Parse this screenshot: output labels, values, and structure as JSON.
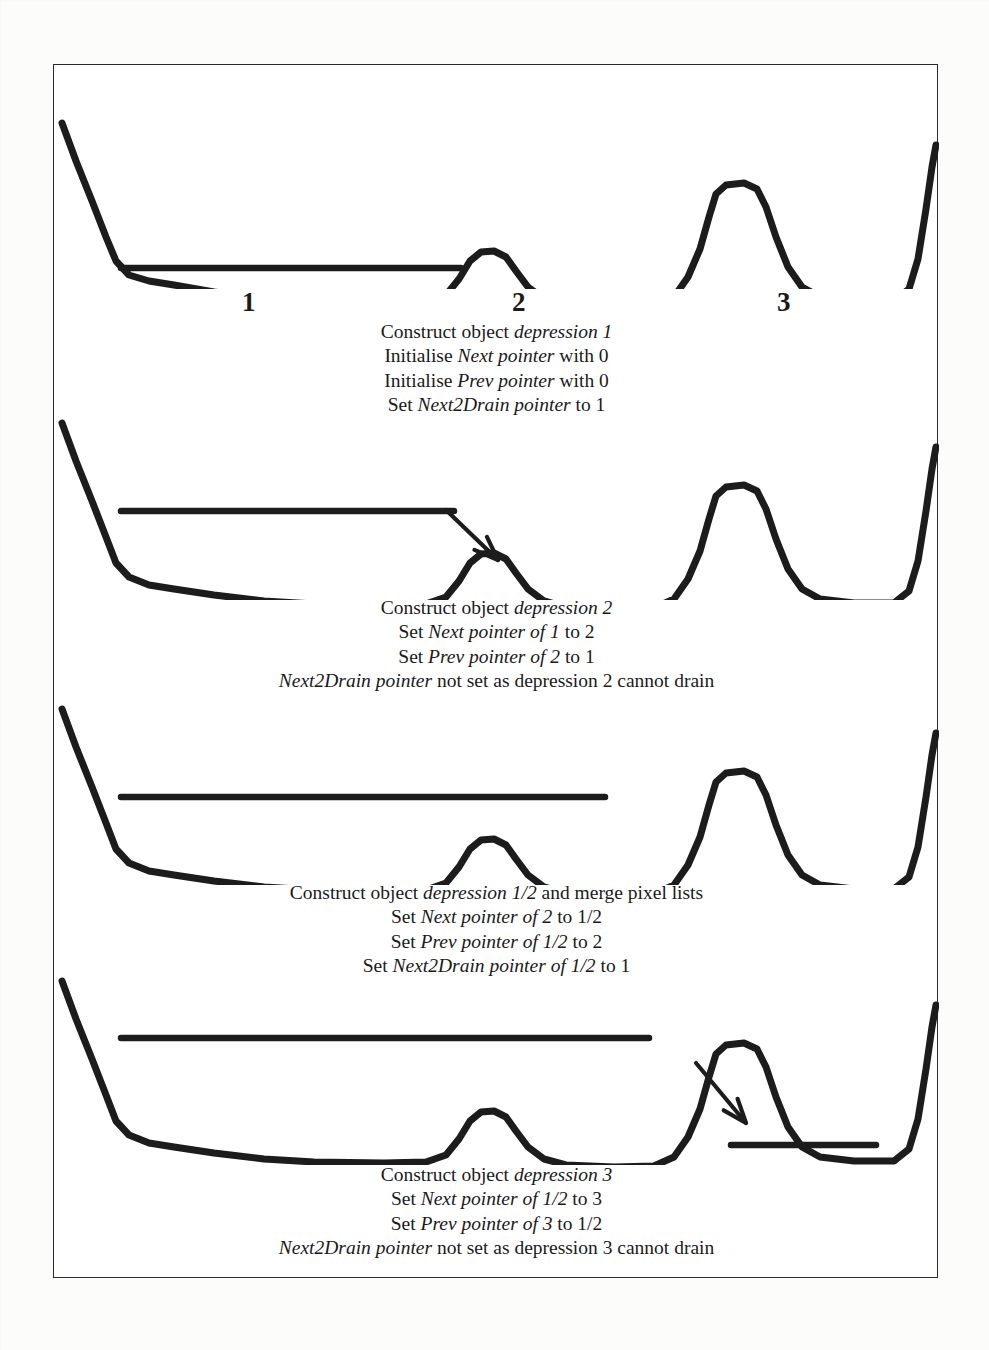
{
  "figure": {
    "depression_labels": [
      {
        "text": "1",
        "x": 188
      },
      {
        "text": "2",
        "x": 458
      },
      {
        "text": "3",
        "x": 723
      }
    ],
    "panels": [
      {
        "id": "panel-1",
        "name": "depression-1-fills",
        "caption": [
          {
            "parts": [
              {
                "t": "Construct object ",
                "i": false
              },
              {
                "t": "depression 1",
                "i": true
              }
            ]
          },
          {
            "parts": [
              {
                "t": "Initialise ",
                "i": false
              },
              {
                "t": "Next pointer",
                "i": true
              },
              {
                "t": " with 0",
                "i": false
              }
            ]
          },
          {
            "parts": [
              {
                "t": "Initialise ",
                "i": false
              },
              {
                "t": "Prev pointer",
                "i": true
              },
              {
                "t": " with 0",
                "i": false
              }
            ]
          },
          {
            "parts": [
              {
                "t": "Set ",
                "i": false
              },
              {
                "t": "Next2Drain pointer",
                "i": true
              },
              {
                "t": " to 1",
                "i": false
              }
            ]
          }
        ],
        "water_lines": [
          {
            "x1": 67,
            "x2": 407,
            "y": 179
          }
        ],
        "arrows": []
      },
      {
        "id": "panel-2",
        "name": "depression-2-spill",
        "caption": [
          {
            "parts": [
              {
                "t": "Construct object ",
                "i": false
              },
              {
                "t": "depression 2",
                "i": true
              }
            ]
          },
          {
            "parts": [
              {
                "t": "Set ",
                "i": false
              },
              {
                "t": "Next pointer of 1",
                "i": true
              },
              {
                "t": " to 2",
                "i": false
              }
            ]
          },
          {
            "parts": [
              {
                "t": "Set ",
                "i": false
              },
              {
                "t": "Prev pointer of 2",
                "i": true
              },
              {
                "t": " to 1",
                "i": false
              }
            ]
          },
          {
            "parts": [
              {
                "t": "Next2Drain pointer",
                "i": true
              },
              {
                "t": " not set as depression 2 cannot drain",
                "i": false
              }
            ]
          }
        ],
        "water_lines": [
          {
            "x1": 67,
            "x2": 400,
            "y": 106
          }
        ],
        "arrows": [
          {
            "x1": 392,
            "y1": 105,
            "x2": 444,
            "y2": 155
          }
        ]
      },
      {
        "id": "panel-3",
        "name": "depression-1-2-merged",
        "caption": [
          {
            "parts": [
              {
                "t": "Construct object ",
                "i": false
              },
              {
                "t": "depression 1/2",
                "i": true
              },
              {
                "t": " and merge pixel lists",
                "i": false
              }
            ]
          },
          {
            "parts": [
              {
                "t": "Set ",
                "i": false
              },
              {
                "t": "Next pointer of 2",
                "i": true
              },
              {
                "t": " to 1/2",
                "i": false
              }
            ]
          },
          {
            "parts": [
              {
                "t": "Set ",
                "i": false
              },
              {
                "t": "Prev pointer of 1/2",
                "i": true
              },
              {
                "t": " to 2",
                "i": false
              }
            ]
          },
          {
            "parts": [
              {
                "t": "Set ",
                "i": false
              },
              {
                "t": "Next2Drain pointer of 1/2",
                "i": true
              },
              {
                "t": " to 1",
                "i": false
              }
            ]
          }
        ],
        "water_lines": [
          {
            "x1": 67,
            "x2": 551,
            "y": 108
          }
        ],
        "arrows": []
      },
      {
        "id": "panel-4",
        "name": "depression-3-spill",
        "caption": [
          {
            "parts": [
              {
                "t": "Construct object ",
                "i": false
              },
              {
                "t": "depression 3",
                "i": true
              }
            ]
          },
          {
            "parts": [
              {
                "t": "Set ",
                "i": false
              },
              {
                "t": "Next pointer of 1/2",
                "i": true
              },
              {
                "t": " to 3",
                "i": false
              }
            ]
          },
          {
            "parts": [
              {
                "t": "Set ",
                "i": false
              },
              {
                "t": "Prev pointer of 3",
                "i": true
              },
              {
                "t": " to 1/2",
                "i": false
              }
            ]
          },
          {
            "parts": [
              {
                "t": "Next2Drain pointer",
                "i": true
              },
              {
                "t": " not set as depression 3 cannot drain",
                "i": false
              }
            ]
          }
        ],
        "water_lines": [
          {
            "x1": 67,
            "x2": 595,
            "y": 73
          },
          {
            "x1": 677,
            "x2": 822,
            "y": 180
          }
        ],
        "arrows": [
          {
            "x1": 642,
            "y1": 98,
            "x2": 692,
            "y2": 158
          }
        ]
      }
    ],
    "terrain": {
      "description": "cross-section profile with three depressions separated by a low saddle peak and a tall peak",
      "stroke_color": "#1c1c1c",
      "stroke_width": 7
    }
  }
}
